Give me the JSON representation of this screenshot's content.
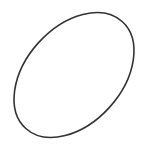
{
  "canvas": {
    "width": 146,
    "height": 145,
    "background": "#ffffff"
  },
  "shape": {
    "type": "ellipse",
    "cx": 74,
    "cy": 75,
    "rx": 72,
    "ry": 48,
    "rotation_deg": -48,
    "stroke": "#333333",
    "stroke_width": 1.6,
    "fill": "none"
  }
}
